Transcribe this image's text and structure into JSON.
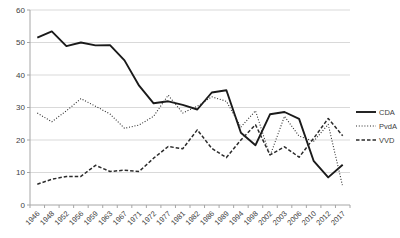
{
  "chart_data": {
    "type": "line",
    "title": "",
    "xlabel": "",
    "ylabel": "",
    "x": [
      "1946",
      "1948",
      "1952",
      "1956",
      "1959",
      "1963",
      "1967",
      "1971",
      "1972",
      "1977",
      "1981",
      "1982",
      "1986",
      "1989",
      "1994",
      "1998",
      "2002",
      "2003",
      "2006",
      "2010",
      "2012",
      "2017"
    ],
    "series": [
      {
        "name": "CDA",
        "style": "solid",
        "stroke_width": 1.9,
        "color": "#1a1a1a",
        "values": [
          51.5,
          53.4,
          48.9,
          50.0,
          49.1,
          49.2,
          44.5,
          36.7,
          31.3,
          31.9,
          30.8,
          29.4,
          34.6,
          35.3,
          22.2,
          18.4,
          27.9,
          28.6,
          26.5,
          13.6,
          8.5,
          12.4
        ]
      },
      {
        "name": "PvdA",
        "style": "dotted",
        "stroke_width": 1.1,
        "color": "#2b2b2b",
        "values": [
          28.3,
          25.6,
          29.0,
          32.7,
          30.4,
          28.0,
          23.6,
          24.6,
          27.3,
          33.8,
          28.3,
          30.4,
          33.3,
          31.9,
          24.0,
          29.0,
          15.1,
          27.3,
          21.2,
          19.6,
          24.8,
          5.7
        ]
      },
      {
        "name": "VVD",
        "style": "dashed",
        "stroke_width": 1.5,
        "color": "#2b2b2b",
        "values": [
          6.4,
          7.9,
          8.8,
          8.8,
          12.2,
          10.3,
          10.7,
          10.3,
          14.4,
          18.0,
          17.3,
          23.1,
          17.4,
          14.6,
          20.0,
          24.7,
          15.4,
          17.9,
          14.7,
          20.5,
          26.6,
          21.3
        ]
      }
    ],
    "ylim": [
      0,
      60
    ],
    "yticks": [
      0,
      10,
      20,
      30,
      40,
      50,
      60
    ],
    "grid": true,
    "legend_position": "right",
    "legend_labels": [
      "CDA",
      "PvdA",
      "VVD"
    ],
    "colors": {
      "gridline": "#d9d9d9",
      "axis": "#a6a6a6",
      "label": "#404040",
      "background": "#ffffff"
    }
  }
}
